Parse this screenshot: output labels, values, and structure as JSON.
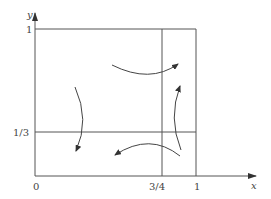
{
  "diagram": {
    "type": "phase-portrait",
    "axes": {
      "x": {
        "label": "x",
        "ticks": [
          {
            "value": "0",
            "label": "0"
          },
          {
            "value": "3/4",
            "label": "3/4"
          },
          {
            "value": "1",
            "label": "1"
          }
        ]
      },
      "y": {
        "label": "y",
        "ticks": [
          {
            "value": "1/3",
            "label": "1/3"
          },
          {
            "value": "1",
            "label": "1"
          }
        ]
      }
    },
    "labels": {
      "origin": "0",
      "x_three_quarters": "3/4",
      "x_one": "1",
      "y_one_third": "1/3",
      "y_one": "1",
      "x_axis": "x",
      "y_axis": "y"
    },
    "lines": {
      "horizontal_one_third": "y = 1/3",
      "vertical_three_quarters": "x = 3/4",
      "top_boundary": "y = 1",
      "right_boundary": "x = 1"
    },
    "flow_arrows": [
      {
        "id": "left",
        "direction": "down"
      },
      {
        "id": "top",
        "direction": "right"
      },
      {
        "id": "right",
        "direction": "up"
      },
      {
        "id": "bottom",
        "direction": "left"
      }
    ],
    "colors": {
      "stroke": "#555555",
      "background": "#ffffff"
    }
  }
}
